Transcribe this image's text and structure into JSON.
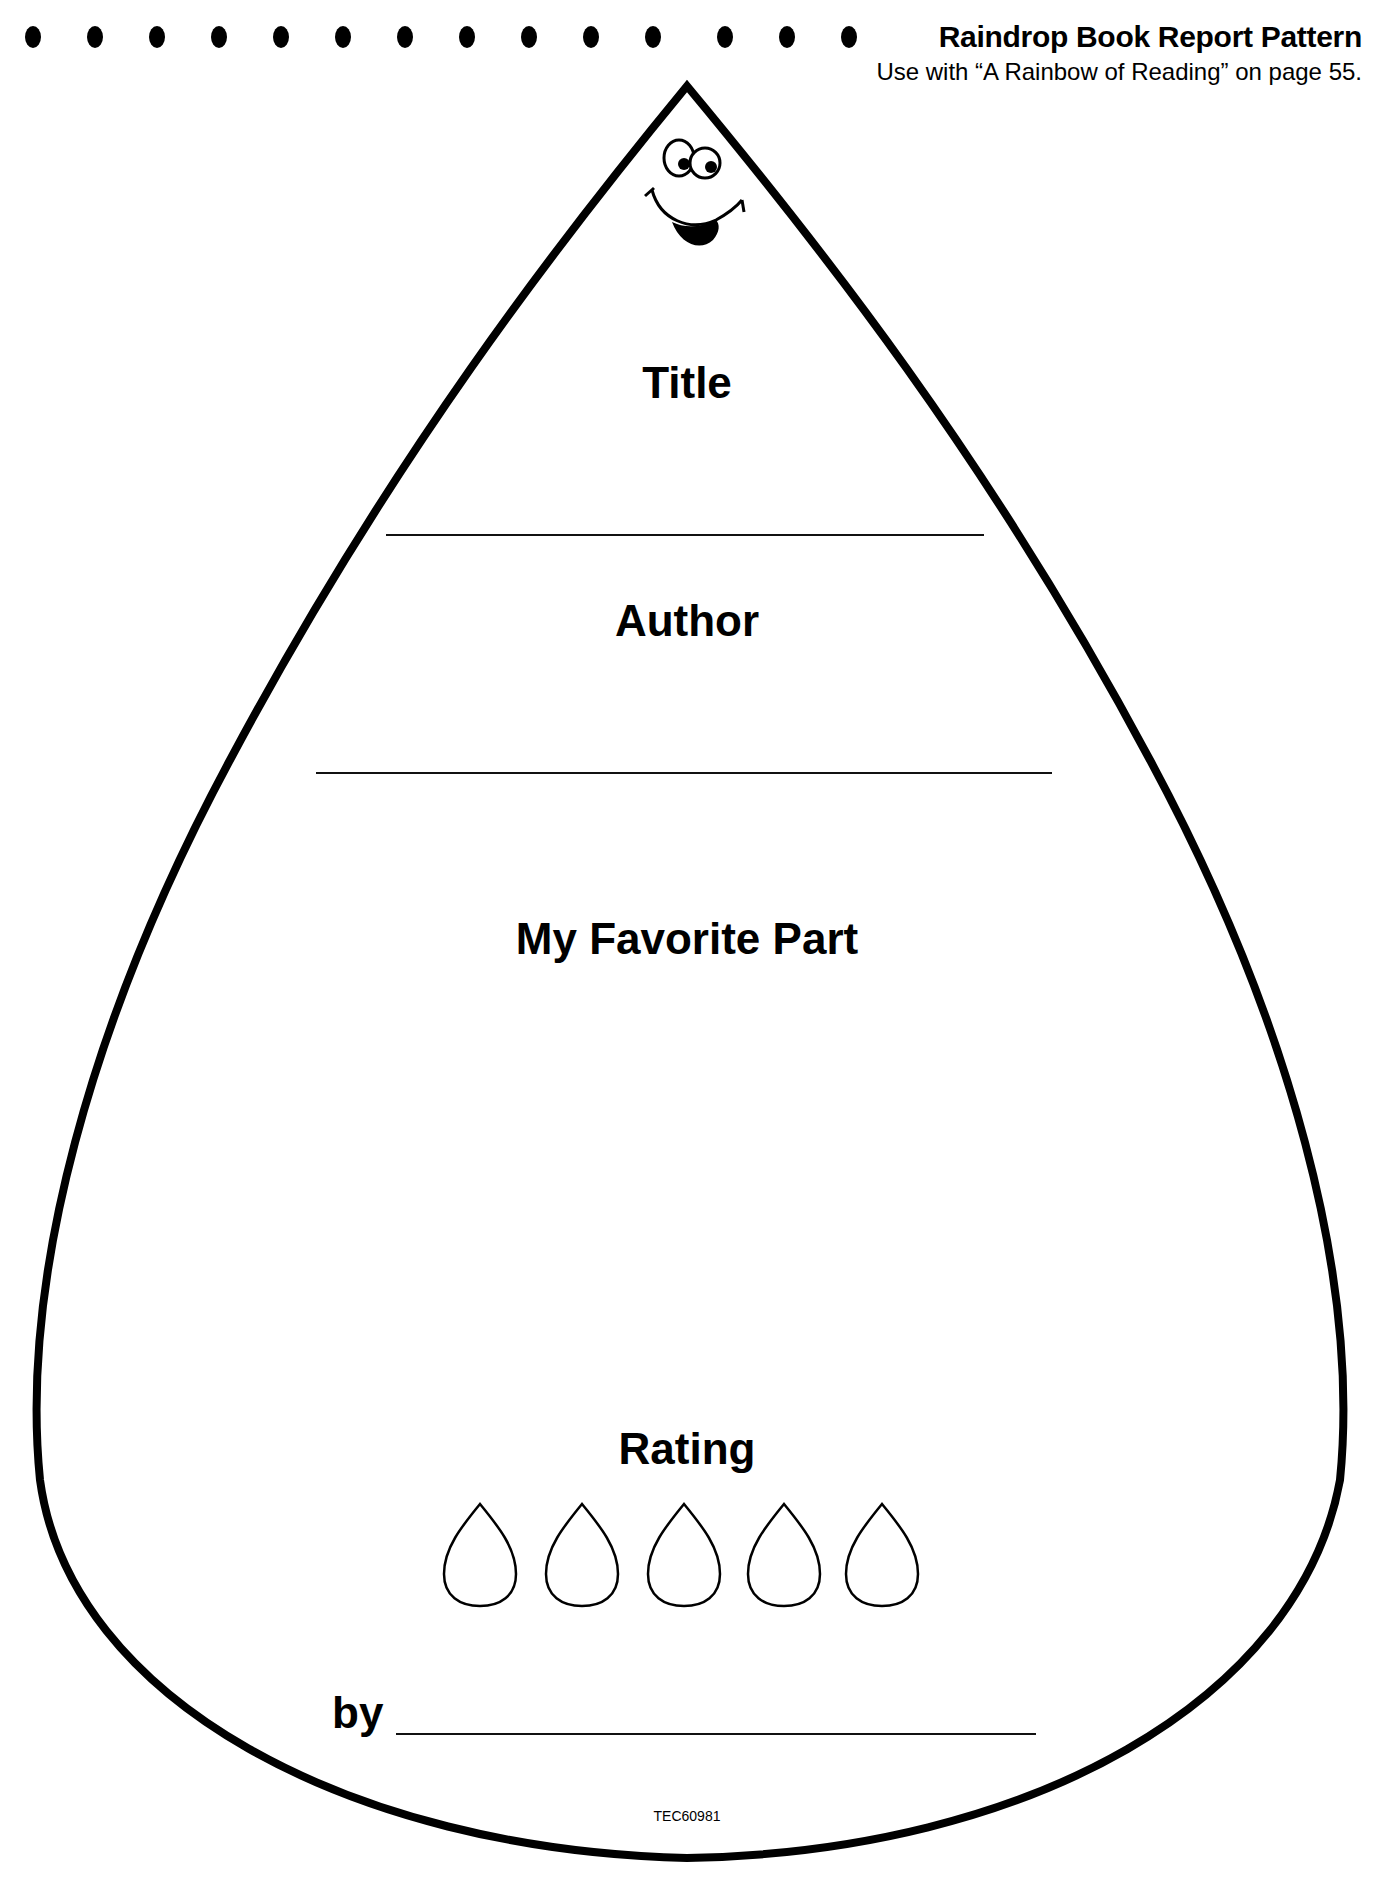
{
  "header": {
    "title": "Raindrop Book Report Pattern",
    "subtitle": "Use with “A Rainbow of Reading” on page 55.",
    "dot_count": 14
  },
  "form": {
    "title_label": "Title",
    "author_label": "Author",
    "favorite_part_label": "My Favorite Part",
    "rating_label": "Rating",
    "rating_drop_count": 5,
    "by_label": "by"
  },
  "footer": {
    "code": "TEC60981"
  },
  "colors": {
    "ink": "#000000",
    "paper": "#ffffff"
  }
}
